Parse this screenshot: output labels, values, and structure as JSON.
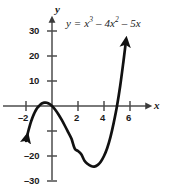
{
  "figure": {
    "equation_label": "y = x³ – 4x² – 5x",
    "equation_parts": {
      "lhs": "y",
      "equals": "=",
      "term1_base": "x",
      "term1_exp": "3",
      "minus1": "– 4",
      "term2_base": "x",
      "term2_exp": "2",
      "minus2": "– 5",
      "term3_base": "x"
    },
    "x_axis_name": "x",
    "y_axis_name": "y",
    "x_tick_labels": [
      "–2",
      "2",
      "4",
      "6"
    ],
    "y_tick_labels": [
      "30",
      "20",
      "10",
      "–20",
      "–30"
    ],
    "curve_color": "#111111",
    "axis_color": "#4d4d4d",
    "background_color": "#ffffff"
  },
  "chart_data": {
    "type": "line",
    "title": "",
    "subtitle": "",
    "equation": "y = x^3 - 4x^2 - 5x",
    "xlabel": "x",
    "ylabel": "y",
    "xlim": [
      -2.9,
      6.9
    ],
    "ylim": [
      -33,
      33
    ],
    "xticks": [
      -2,
      2,
      4,
      6
    ],
    "xtick_labels": [
      "–2",
      "2",
      "4",
      "6"
    ],
    "yticks": [
      30,
      20,
      10,
      -10,
      -20,
      -30
    ],
    "ytick_labels": [
      "30",
      "20",
      "10",
      "",
      "–20",
      "–30"
    ],
    "grid": false,
    "legend": false,
    "annotations": [
      {
        "text": "y = x³ – 4x² – 5x",
        "x": 1.1,
        "y": 30
      }
    ],
    "features": {
      "roots": [
        -1,
        0,
        5
      ],
      "local_maximum": {
        "x": -0.5225,
        "y": 1.4
      },
      "local_minimum": {
        "x": 3.1892,
        "y": -24.2
      },
      "arrow_start_visible": {
        "x": -1.9,
        "y": -32
      },
      "arrow_end_visible": {
        "x": 5.65,
        "y": 25
      }
    },
    "series": [
      {
        "name": "y = x^3 - 4x^2 - 5x",
        "x": [
          -2.0,
          -1.9,
          -1.8,
          -1.7,
          -1.6,
          -1.5,
          -1.4,
          -1.3,
          -1.2,
          -1.1,
          -1.0,
          -0.9,
          -0.8,
          -0.7,
          -0.6,
          -0.5,
          -0.4,
          -0.3,
          -0.2,
          -0.1,
          0.0,
          0.25,
          0.5,
          0.75,
          1.0,
          1.25,
          1.5,
          1.75,
          2.0,
          2.25,
          2.5,
          2.75,
          3.0,
          3.25,
          3.5,
          3.75,
          4.0,
          4.25,
          4.5,
          4.75,
          5.0,
          5.25,
          5.5,
          5.65
        ],
        "y": [
          -14.0,
          -11.69,
          -9.61,
          -7.75,
          -6.08,
          -4.62,
          -3.34,
          -2.24,
          -1.32,
          -0.56,
          0.0,
          0.54,
          0.93,
          1.2,
          1.34,
          1.38,
          1.3,
          1.11,
          0.84,
          0.46,
          0.0,
          -1.48,
          -3.38,
          -5.58,
          -8.0,
          -10.55,
          -13.13,
          -17.06,
          -18.0,
          -19.34,
          -21.88,
          -23.23,
          -24.0,
          -24.22,
          -23.63,
          -22.27,
          -20.0,
          -16.8,
          -12.38,
          -6.65,
          0.0,
          8.2,
          18.0,
          24.35
        ]
      }
    ]
  }
}
